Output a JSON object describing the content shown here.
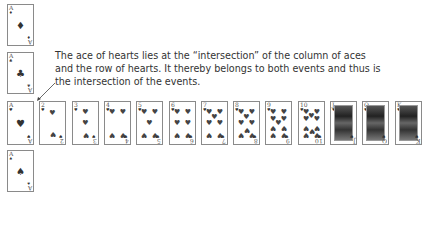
{
  "caption": "The ace of hearts lies at the “intersection” of the column of aces and the row of hearts. It thereby belongs to both events and thus is the intersection of the events.",
  "ace_column": [
    {
      "rank": "A",
      "suit": "diamonds",
      "symbol": "♦"
    },
    {
      "rank": "A",
      "suit": "clubs",
      "symbol": "♣"
    },
    {
      "rank": "A",
      "suit": "hearts",
      "symbol": "♥"
    },
    {
      "rank": "A",
      "suit": "spades",
      "symbol": "♠"
    }
  ],
  "hearts_row": [
    {
      "rank": "A"
    },
    {
      "rank": "2"
    },
    {
      "rank": "3"
    },
    {
      "rank": "4"
    },
    {
      "rank": "5"
    },
    {
      "rank": "6"
    },
    {
      "rank": "7"
    },
    {
      "rank": "8"
    },
    {
      "rank": "9"
    },
    {
      "rank": "10"
    },
    {
      "rank": "J"
    },
    {
      "rank": "Q"
    },
    {
      "rank": "K"
    }
  ],
  "heart_symbol": "♥"
}
